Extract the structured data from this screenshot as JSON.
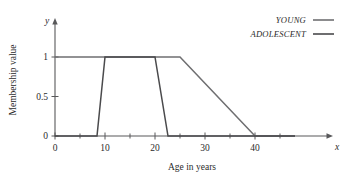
{
  "chart_data": {
    "type": "line",
    "title": "",
    "xlabel": "Age in years",
    "ylabel": "Membership value",
    "x_axis_symbol": "x",
    "y_axis_symbol": "y",
    "xlim": [
      0,
      48
    ],
    "ylim": [
      0,
      1.12
    ],
    "grid": false,
    "legend_position": "top-right",
    "x_ticks_major": [
      0,
      10,
      20,
      30,
      40
    ],
    "x_tick_labels": [
      "0",
      "10",
      "20",
      "30",
      "40"
    ],
    "x_ticks_minor": [
      5,
      15,
      25,
      35,
      45
    ],
    "y_ticks": [
      0,
      0.5,
      1
    ],
    "y_tick_labels": [
      "0",
      "0.5",
      "1"
    ],
    "series": [
      {
        "name": "YOUNG",
        "color": "#6f6f71",
        "points": [
          [
            0,
            1
          ],
          [
            25,
            1
          ],
          [
            40,
            0
          ],
          [
            48,
            0
          ]
        ]
      },
      {
        "name": "ADOLESCENT",
        "color": "#4a4a4c",
        "points": [
          [
            0,
            0
          ],
          [
            8.4,
            0
          ],
          [
            10,
            1
          ],
          [
            20,
            1
          ],
          [
            22.6,
            0
          ],
          [
            48,
            0
          ]
        ]
      }
    ]
  },
  "legend": {
    "entries": [
      {
        "label": "YOUNG",
        "color": "#6f6f71"
      },
      {
        "label": "ADOLESCENT",
        "color": "#4a4a4c"
      }
    ]
  },
  "colors": {
    "axis": "#58585a",
    "text": "#2b2b2b",
    "background": "#ffffff"
  }
}
